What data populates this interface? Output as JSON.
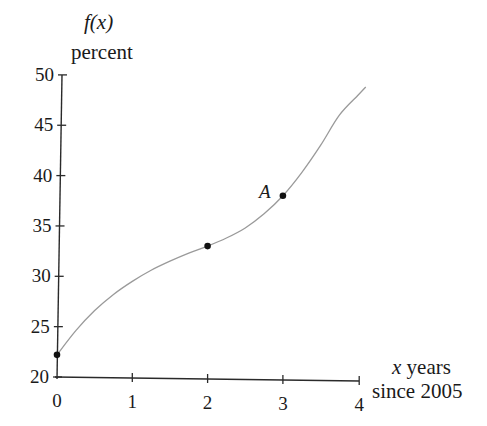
{
  "chart_data": {
    "type": "line",
    "title": "",
    "ylabel_line1": "f(x)",
    "ylabel_line2": "percent",
    "xlabel_var": "x",
    "xlabel_line1_rest": " years",
    "xlabel_line2": "since 2005",
    "x_ticks": [
      "0",
      "1",
      "2",
      "3",
      "4"
    ],
    "y_ticks": [
      "20",
      "25",
      "30",
      "35",
      "40",
      "45",
      "50"
    ],
    "xlim": [
      0,
      4
    ],
    "ylim": [
      20,
      50
    ],
    "grid": false,
    "legend": null,
    "series": [
      {
        "name": "f(x)",
        "color": "#9a9a9a",
        "x": [
          0,
          0.25,
          0.5,
          0.75,
          1.0,
          1.25,
          1.5,
          1.75,
          2.0,
          2.25,
          2.5,
          2.75,
          3.0,
          3.25,
          3.5,
          3.75,
          4.0,
          4.1
        ],
        "y": [
          22.2,
          24.6,
          26.6,
          28.2,
          29.5,
          30.6,
          31.5,
          32.3,
          33.0,
          33.8,
          34.8,
          36.2,
          38.0,
          40.3,
          43.0,
          46.0,
          48.0,
          48.8
        ]
      }
    ],
    "points": [
      {
        "x": 0,
        "y": 22.2,
        "label": ""
      },
      {
        "x": 2,
        "y": 33,
        "label": ""
      },
      {
        "x": 3,
        "y": 38,
        "label": "A"
      }
    ]
  },
  "colors": {
    "axis": "#2a2a2a",
    "curve": "#9a9a9a",
    "point": "#111111",
    "text": "#1a1a1a"
  }
}
